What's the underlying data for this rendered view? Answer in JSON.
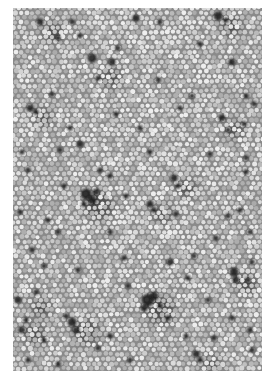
{
  "image": {
    "description": "Grayscale micrograph of a densely packed cell mosaic with scattered dark cells",
    "frame": {
      "x": 13,
      "y": 8,
      "width": 249,
      "height": 363
    },
    "background_color": "#ffffff",
    "tissue_base_color": "#8a8a8a",
    "cell_color_light": "#e6e6e6",
    "cell_color_mid": "#c4c4c4",
    "dark_cell_color": "#1a1a1a",
    "cell_diameter_px": 5.6
  },
  "dark_blobs": [
    [
      40,
      22,
      4
    ],
    [
      58,
      38,
      3
    ],
    [
      80,
      36,
      3
    ],
    [
      92,
      58,
      5
    ],
    [
      118,
      48,
      3
    ],
    [
      98,
      78,
      3
    ],
    [
      112,
      62,
      4
    ],
    [
      72,
      22,
      3
    ],
    [
      136,
      18,
      4
    ],
    [
      160,
      22,
      3
    ],
    [
      218,
      16,
      5
    ],
    [
      226,
      20,
      3
    ],
    [
      232,
      62,
      4
    ],
    [
      158,
      80,
      3
    ],
    [
      192,
      96,
      3
    ],
    [
      222,
      118,
      4
    ],
    [
      228,
      130,
      3
    ],
    [
      244,
      124,
      3
    ],
    [
      180,
      108,
      3
    ],
    [
      30,
      108,
      4
    ],
    [
      36,
      112,
      3
    ],
    [
      52,
      94,
      3
    ],
    [
      70,
      128,
      3
    ],
    [
      60,
      150,
      3
    ],
    [
      22,
      152,
      3
    ],
    [
      28,
      170,
      3
    ],
    [
      80,
      144,
      4
    ],
    [
      100,
      170,
      3
    ],
    [
      110,
      176,
      3
    ],
    [
      126,
      196,
      3
    ],
    [
      174,
      178,
      4
    ],
    [
      178,
      186,
      3
    ],
    [
      246,
      158,
      3
    ],
    [
      246,
      172,
      3
    ],
    [
      150,
      152,
      3
    ],
    [
      86,
      194,
      6
    ],
    [
      92,
      200,
      5
    ],
    [
      96,
      192,
      4
    ],
    [
      84,
      204,
      3
    ],
    [
      48,
      220,
      3
    ],
    [
      58,
      232,
      3
    ],
    [
      150,
      204,
      4
    ],
    [
      154,
      210,
      3
    ],
    [
      176,
      214,
      3
    ],
    [
      228,
      216,
      3
    ],
    [
      240,
      210,
      3
    ],
    [
      20,
      212,
      3
    ],
    [
      32,
      250,
      3
    ],
    [
      44,
      266,
      3
    ],
    [
      78,
      270,
      3
    ],
    [
      124,
      258,
      3
    ],
    [
      128,
      286,
      3
    ],
    [
      170,
      262,
      4
    ],
    [
      188,
      278,
      3
    ],
    [
      208,
      300,
      3
    ],
    [
      234,
      272,
      5
    ],
    [
      236,
      280,
      4
    ],
    [
      248,
      280,
      3
    ],
    [
      252,
      262,
      3
    ],
    [
      216,
      238,
      3
    ],
    [
      194,
      256,
      3
    ],
    [
      232,
      318,
      3
    ],
    [
      148,
      300,
      7
    ],
    [
      154,
      296,
      5
    ],
    [
      144,
      308,
      4
    ],
    [
      160,
      306,
      3
    ],
    [
      168,
      318,
      3
    ],
    [
      36,
      292,
      3
    ],
    [
      18,
      300,
      4
    ],
    [
      22,
      330,
      4
    ],
    [
      26,
      320,
      3
    ],
    [
      72,
      322,
      5
    ],
    [
      76,
      330,
      4
    ],
    [
      66,
      316,
      3
    ],
    [
      110,
      336,
      3
    ],
    [
      98,
      348,
      3
    ],
    [
      196,
      354,
      4
    ],
    [
      200,
      360,
      3
    ],
    [
      252,
      350,
      3
    ],
    [
      250,
      330,
      3
    ],
    [
      130,
      360,
      3
    ],
    [
      28,
      360,
      3
    ],
    [
      58,
      364,
      3
    ],
    [
      246,
      96,
      3
    ],
    [
      254,
      104,
      3
    ],
    [
      200,
      44,
      3
    ],
    [
      140,
      128,
      3
    ],
    [
      116,
      114,
      3
    ],
    [
      64,
      186,
      3
    ],
    [
      210,
      154,
      3
    ],
    [
      250,
      232,
      3
    ],
    [
      110,
      232,
      3
    ],
    [
      186,
      336,
      3
    ],
    [
      214,
      338,
      3
    ],
    [
      44,
      340,
      3
    ]
  ],
  "shadow_patches": [
    [
      86,
      198,
      14
    ],
    [
      148,
      302,
      14
    ],
    [
      74,
      324,
      12
    ],
    [
      234,
      276,
      10
    ],
    [
      40,
      24,
      10
    ],
    [
      218,
      18,
      10
    ],
    [
      22,
      326,
      10
    ],
    [
      30,
      110,
      9
    ],
    [
      174,
      180,
      9
    ],
    [
      222,
      122,
      9
    ],
    [
      150,
      206,
      9
    ],
    [
      98,
      70,
      10
    ],
    [
      198,
      356,
      8
    ],
    [
      28,
      300,
      9
    ]
  ]
}
